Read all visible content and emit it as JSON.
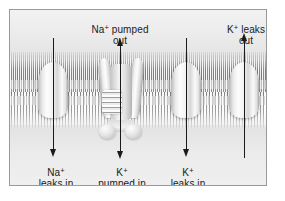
{
  "figure": {
    "colors": {
      "frame_border": "#9a9a9a",
      "background": "#ededed",
      "arrow": "#1a1a1a",
      "text": "#1a1a1a"
    }
  },
  "labels": {
    "na_pumped_out": {
      "line1_ion": "Na",
      "line1_charge": "+",
      "line1_rest": " pumped",
      "line2": "out"
    },
    "k_leaks_out": {
      "line1_ion": "K",
      "line1_charge": "+",
      "line1_rest": " leaks",
      "line2": "out"
    },
    "na_leaks_in": {
      "line1_ion": "Na",
      "line1_charge": "+",
      "line1_rest": "",
      "line2": "leaks in"
    },
    "k_pumped_in": {
      "line1_ion": "K",
      "line1_charge": "+",
      "line1_rest": "",
      "line2": "pumped in"
    },
    "k_leaks_in": {
      "line1_ion": "K",
      "line1_charge": "+",
      "line1_rest": "",
      "line2": "leaks in"
    }
  },
  "arrows": [
    {
      "name": "na-leaks-in",
      "direction": "down",
      "ion": "Na+",
      "process": "leaks in"
    },
    {
      "name": "na-pumped-out",
      "direction": "up",
      "ion": "Na+",
      "process": "pumped out"
    },
    {
      "name": "k-pumped-in",
      "direction": "down",
      "ion": "K+",
      "process": "pumped in"
    },
    {
      "name": "k-leaks-in",
      "direction": "down",
      "ion": "K+",
      "process": "leaks in"
    },
    {
      "name": "k-leaks-out",
      "direction": "up",
      "ion": "K+",
      "process": "leaks out"
    }
  ],
  "structures": [
    {
      "name": "channel-protein-left",
      "type": "leak channel"
    },
    {
      "name": "sodium-potassium-pump",
      "type": "active transport pump"
    },
    {
      "name": "channel-protein-mid",
      "type": "leak channel"
    },
    {
      "name": "channel-protein-right",
      "type": "leak channel"
    },
    {
      "name": "phospholipid-bilayer",
      "type": "membrane"
    }
  ]
}
